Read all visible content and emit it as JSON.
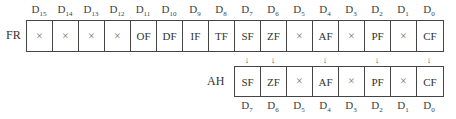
{
  "fr": {
    "label": "FR",
    "bit_labels": [
      {
        "base": "D",
        "sub": "15"
      },
      {
        "base": "D",
        "sub": "14"
      },
      {
        "base": "D",
        "sub": "13"
      },
      {
        "base": "D",
        "sub": "12"
      },
      {
        "base": "D",
        "sub": "11"
      },
      {
        "base": "D",
        "sub": "10"
      },
      {
        "base": "D",
        "sub": "9"
      },
      {
        "base": "D",
        "sub": "8"
      },
      {
        "base": "D",
        "sub": "7"
      },
      {
        "base": "D",
        "sub": "6"
      },
      {
        "base": "D",
        "sub": "5"
      },
      {
        "base": "D",
        "sub": "4"
      },
      {
        "base": "D",
        "sub": "3"
      },
      {
        "base": "D",
        "sub": "2"
      },
      {
        "base": "D",
        "sub": "1"
      },
      {
        "base": "D",
        "sub": "0"
      }
    ],
    "cells": [
      "×",
      "×",
      "×",
      "×",
      "OF",
      "DF",
      "IF",
      "TF",
      "SF",
      "ZF",
      "×",
      "AF",
      "×",
      "PF",
      "×",
      "CF"
    ]
  },
  "arrows": [
    "↓",
    "↓",
    "",
    "↓",
    "",
    "↓",
    "",
    "↓"
  ],
  "ah": {
    "label": "AH",
    "cells": [
      "SF",
      "ZF",
      "×",
      "AF",
      "×",
      "PF",
      "×",
      "CF"
    ],
    "bit_labels": [
      {
        "base": "D",
        "sub": "7"
      },
      {
        "base": "D",
        "sub": "6"
      },
      {
        "base": "D",
        "sub": "5"
      },
      {
        "base": "D",
        "sub": "4"
      },
      {
        "base": "D",
        "sub": "3"
      },
      {
        "base": "D",
        "sub": "2"
      },
      {
        "base": "D",
        "sub": "1"
      },
      {
        "base": "D",
        "sub": "0"
      }
    ]
  }
}
